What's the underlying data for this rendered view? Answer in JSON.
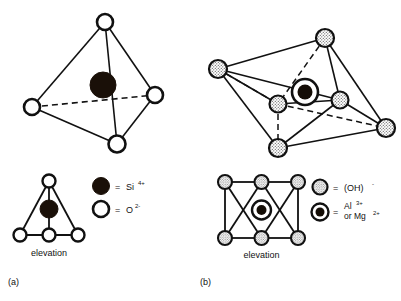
{
  "figure": {
    "background_color": "#ffffff",
    "stroke_color": "#111111",
    "fill_dark": "#1a1008",
    "fill_open": "#ffffff",
    "stipple_color": "#8a8a8a"
  },
  "panels": [
    {
      "id": "a",
      "label": "(a)",
      "perspective_name": "silica-tetrahedron",
      "elevation_label": "elevation",
      "vertex_symbol": "open-circle",
      "center_symbol": "filled-circle",
      "vertex_count": 4,
      "center_count": 1
    },
    {
      "id": "b",
      "label": "(b)",
      "perspective_name": "alumina-octahedron",
      "elevation_label": "elevation",
      "vertex_symbol": "stippled-circle",
      "center_symbol": "bullseye-circle",
      "vertex_count": 6,
      "center_count": 1
    }
  ],
  "legends": {
    "left": {
      "name": "tetrahedron-legend",
      "entries": [
        {
          "marker": "filled-circle",
          "equals": "=",
          "species": "Si",
          "charge": "4+",
          "full": "= Si4+"
        },
        {
          "marker": "open-circle",
          "equals": "=",
          "species": "O",
          "charge": "2-",
          "full": "= O2-"
        }
      ]
    },
    "right": {
      "name": "octahedron-legend",
      "entries": [
        {
          "marker": "stippled-circle",
          "equals": "=",
          "species": "(OH)",
          "charge": "-",
          "full": "= (OH)-"
        },
        {
          "marker": "bullseye-circle",
          "equals": "=",
          "species_line1": "Al",
          "charge_line1": "3+",
          "species_line2": "or Mg",
          "charge_line2": "2+",
          "full": "= Al3+ or Mg2+"
        }
      ]
    }
  },
  "geometry": {
    "tetrahedron_vertices": [
      {
        "name": "apex",
        "x": 105,
        "y": 22
      },
      {
        "name": "left",
        "x": 32,
        "y": 107
      },
      {
        "name": "right",
        "x": 155,
        "y": 95
      },
      {
        "name": "front",
        "x": 117,
        "y": 144
      }
    ],
    "tetrahedron_center": {
      "x": 103,
      "y": 85
    },
    "octahedron_vertices": [
      {
        "name": "top",
        "x": 325,
        "y": 38
      },
      {
        "name": "left",
        "x": 218,
        "y": 69
      },
      {
        "name": "inner-front",
        "x": 278,
        "y": 104
      },
      {
        "name": "right-upper",
        "x": 340,
        "y": 100
      },
      {
        "name": "right-far",
        "x": 386,
        "y": 128
      },
      {
        "name": "bottom",
        "x": 278,
        "y": 148
      }
    ],
    "octahedron_center": {
      "x": 305,
      "y": 92
    }
  }
}
